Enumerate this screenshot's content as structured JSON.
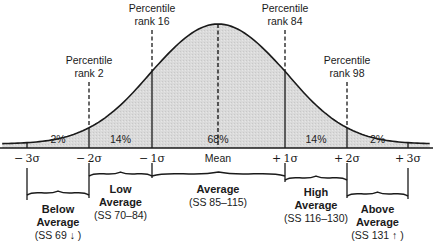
{
  "chart_data": {
    "type": "area",
    "title": "",
    "xlabel": "",
    "ylabel": "",
    "grid": false,
    "legend": null,
    "x_ticks": [
      "-3σ",
      "-2σ",
      "-1σ",
      "Mean",
      "+1σ",
      "+2σ",
      "+3σ"
    ],
    "x_tick_values": [
      -3,
      -2,
      -1,
      0,
      1,
      2,
      3
    ],
    "regions": [
      {
        "from": -3,
        "to": -2,
        "label": "2%",
        "value": 2
      },
      {
        "from": -2,
        "to": -1,
        "label": "14%",
        "value": 14
      },
      {
        "from": -1,
        "to": 1,
        "label": "68%",
        "value": 68
      },
      {
        "from": 1,
        "to": 2,
        "label": "14%",
        "value": 14
      },
      {
        "from": 2,
        "to": 3,
        "label": "2%",
        "value": 2
      }
    ],
    "percentile_markers": [
      {
        "at": -2,
        "line1": "Percentile",
        "line2": "rank 2",
        "rank": 2
      },
      {
        "at": -1,
        "line1": "Percentile",
        "line2": "rank 16",
        "rank": 16
      },
      {
        "at": 1,
        "line1": "Percentile",
        "line2": "rank 84",
        "rank": 84
      },
      {
        "at": 2,
        "line1": "Percentile",
        "line2": "rank 98",
        "rank": 98
      }
    ],
    "classifications": [
      {
        "from": -3,
        "to": -2,
        "line1": "Below",
        "line2": "Average",
        "range": "(SS 69 ↓ )"
      },
      {
        "from": -2,
        "to": -1,
        "line1": "Low",
        "line2": "Average",
        "range": "(SS 70–84)"
      },
      {
        "from": -1,
        "to": 1,
        "line1": "Average",
        "line2": "",
        "range": "(SS 85–115)"
      },
      {
        "from": 1,
        "to": 2,
        "line1": "High",
        "line2": "Average",
        "range": "(SS 116–130)"
      },
      {
        "from": 2,
        "to": 3,
        "line1": "Above",
        "line2": "Average",
        "range": "(SS 131 ↑ )"
      }
    ],
    "colors": {
      "fill": "#d9d9d9",
      "stroke": "#1a1a1a",
      "background": "#ffffff"
    }
  }
}
